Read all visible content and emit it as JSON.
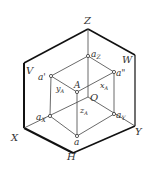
{
  "diagram": {
    "planes": {
      "V": "V",
      "H": "H",
      "W": "W"
    },
    "axes": {
      "X": "X",
      "Y": "Y",
      "Z": "Z",
      "O": "O"
    },
    "points": {
      "A": "A",
      "a": "a",
      "a_prime": "a'",
      "a_dprime": "a\"",
      "aX": "a",
      "aX_sub": "X",
      "aY": "a",
      "aY_sub": "Y",
      "aZ": "a",
      "aZ_sub": "Z"
    },
    "dims": {
      "xA": "x",
      "xA_sub": "A",
      "yA": "y",
      "yA_sub": "A",
      "zA": "z",
      "zA_sub": "A"
    }
  }
}
